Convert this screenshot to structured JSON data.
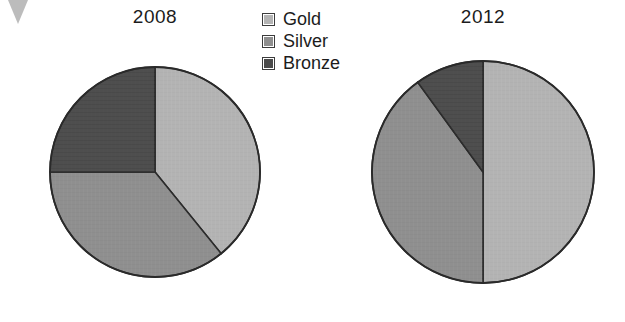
{
  "legend": {
    "position": "top-center",
    "entries": [
      {
        "label": "Gold",
        "color": "#b4b4b4"
      },
      {
        "label": "Silver",
        "color": "#8f8f8f"
      },
      {
        "label": "Bronze",
        "color": "#4a4a4a"
      }
    ]
  },
  "charts": [
    {
      "title": "2008"
    },
    {
      "title": "2012"
    }
  ],
  "chart_data": [
    {
      "type": "pie",
      "title": "2008",
      "labels": [
        "Gold",
        "Silver",
        "Bronze"
      ],
      "values": [
        39,
        36,
        25
      ],
      "units": "percent",
      "colors": [
        "#b4b4b4",
        "#8f8f8f",
        "#4a4a4a"
      ],
      "start_angle_deg": 0,
      "direction": "clockwise",
      "slice_angles_deg": [
        141,
        129,
        90
      ],
      "legend": "shared",
      "grid": false
    },
    {
      "type": "pie",
      "title": "2012",
      "labels": [
        "Gold",
        "Silver",
        "Bronze"
      ],
      "values": [
        50,
        40,
        10
      ],
      "units": "percent",
      "colors": [
        "#b4b4b4",
        "#8f8f8f",
        "#4a4a4a"
      ],
      "start_angle_deg": 0,
      "direction": "clockwise",
      "slice_angles_deg": [
        180,
        144,
        36
      ],
      "legend": "shared",
      "grid": false
    }
  ]
}
